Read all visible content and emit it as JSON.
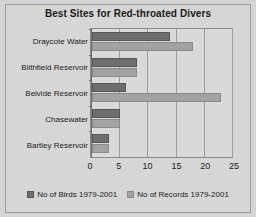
{
  "chart_data": {
    "type": "bar",
    "orientation": "horizontal",
    "title": "Best Sites for Red-throated Divers",
    "xlabel": "",
    "ylabel": "",
    "xlim": [
      0,
      25
    ],
    "xticks": [
      0,
      5,
      10,
      15,
      20,
      25
    ],
    "grid": true,
    "legend_position": "bottom",
    "categories": [
      "Draycote Water",
      "Blithfield Reservoir",
      "Belvide Reservoir",
      "Chasewater",
      "Bartley Reservoir"
    ],
    "series": [
      {
        "name": "No of Birds 1979-2001",
        "color": "#6e6e6e",
        "values": [
          14,
          8,
          6,
          5,
          3
        ]
      },
      {
        "name": "No of Records 1979-2001",
        "color": "#a2a2a2",
        "values": [
          18,
          8,
          23,
          5,
          3
        ]
      }
    ]
  },
  "colors": {
    "background": "#d4d4d4",
    "plot_background": "#d9d9d9",
    "axis": "#6f6f6f",
    "gridline": "#9d9d9d",
    "text": "#1b1b1b",
    "series_birds": "#6e6e6e",
    "series_records": "#a2a2a2"
  }
}
